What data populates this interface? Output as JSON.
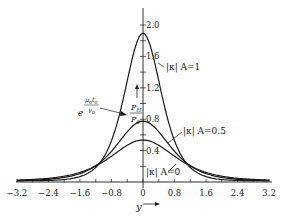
{
  "chart_data": {
    "type": "line",
    "title": "",
    "xlabel": "y",
    "ylabel": "P_H / P_0 · e^(μ0 t0 / γ0)",
    "xlim": [
      -3.2,
      3.2
    ],
    "ylim": [
      0,
      2.0
    ],
    "x_ticks": [
      "-3.2",
      "-2.4",
      "-1.6",
      "-0.8",
      "0",
      "0.8",
      "1.6",
      "2.4",
      "3.2"
    ],
    "y_ticks": [
      "0.4",
      "0.8",
      "1.2",
      "1.6",
      "2.0"
    ],
    "grid": false,
    "legend": "inline labels",
    "x": [
      -3.2,
      -2.8,
      -2.4,
      -2.0,
      -1.6,
      -1.2,
      -0.8,
      -0.4,
      0,
      0.4,
      0.8,
      1.2,
      1.6,
      2.0,
      2.4,
      2.8,
      3.2
    ],
    "series": [
      {
        "name": "|κ| A=1",
        "peak": 1.88,
        "values": [
          0.02,
          0.04,
          0.07,
          0.12,
          0.22,
          0.42,
          0.85,
          1.5,
          1.88,
          1.5,
          0.85,
          0.42,
          0.22,
          0.12,
          0.07,
          0.04,
          0.02
        ]
      },
      {
        "name": "|κ| A=0.5",
        "peak": 0.76,
        "values": [
          0.02,
          0.03,
          0.05,
          0.09,
          0.16,
          0.28,
          0.46,
          0.66,
          0.76,
          0.66,
          0.46,
          0.28,
          0.16,
          0.09,
          0.05,
          0.03,
          0.02
        ]
      },
      {
        "name": "|κ| A=0",
        "peak": 0.52,
        "values": [
          0.02,
          0.03,
          0.04,
          0.07,
          0.12,
          0.2,
          0.32,
          0.46,
          0.52,
          0.46,
          0.32,
          0.2,
          0.12,
          0.07,
          0.04,
          0.03,
          0.02
        ]
      }
    ],
    "annotations": {
      "curve_labels": [
        "|κ| A=1",
        "|κ| A=0.5",
        "|κ| A=0"
      ],
      "y_axis_label_top": "P_H",
      "y_axis_label_bottom": "P_0",
      "exp_base": "e",
      "exp_numerator": "μ0 t0",
      "exp_denominator": "γ0",
      "x_axis_label": "y"
    }
  },
  "labels": {
    "a1": "|κ| A=1",
    "a05": "|κ| A=0.5",
    "a0": "|κ| A=0",
    "ph": "P",
    "ph_sub": "H",
    "p0": "P",
    "p0_sub": "0",
    "e": "e",
    "mu": "μ",
    "mu_sub": "0",
    "t": "t",
    "t_sub": "0",
    "gamma": "γ",
    "gamma_sub": "0",
    "xaxis": "y"
  }
}
